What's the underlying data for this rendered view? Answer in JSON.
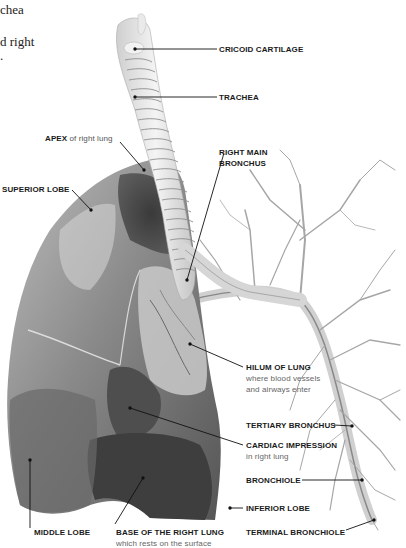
{
  "intro_text": {
    "line1": "chea",
    "line2": "d right",
    "line3": "."
  },
  "labels": {
    "cricoid": {
      "title": "CRICOID CARTILAGE"
    },
    "trachea": {
      "title": "TRACHEA"
    },
    "apex": {
      "title": "APEX",
      "suffix": " of right lung"
    },
    "right_main_bronchus": {
      "line1": "RIGHT MAIN",
      "line2": "BRONCHUS"
    },
    "superior_lobe": {
      "title": "SUPERIOR LOBE"
    },
    "hilum": {
      "title": "HILUM OF LUNG",
      "sub1": "where blood vessels",
      "sub2": "and airways enter"
    },
    "tertiary_bronchus": {
      "title": "TERTIARY BRONCHUS"
    },
    "cardiac_impression": {
      "title": "CARDIAC IMPRESSION",
      "sub": "in right lung"
    },
    "bronchiole": {
      "title": "BRONCHIOLE"
    },
    "inferior_lobe": {
      "title": "INFERIOR LOBE"
    },
    "terminal_bronchiole": {
      "title": "TERMINAL BRONCHIOLE"
    },
    "middle_lobe": {
      "title": "MIDDLE LOBE"
    },
    "base": {
      "title": "BASE OF THE RIGHT LUNG",
      "sub": "which rests on the surface"
    }
  },
  "colors": {
    "leader_line": "#111111",
    "lung_dark": "#4a4a4a",
    "lung_mid": "#7a7a7a",
    "lung_light": "#b8b8b8",
    "trachea": "#e6e6e6",
    "bronchi_tree": "#9a9a9a"
  }
}
